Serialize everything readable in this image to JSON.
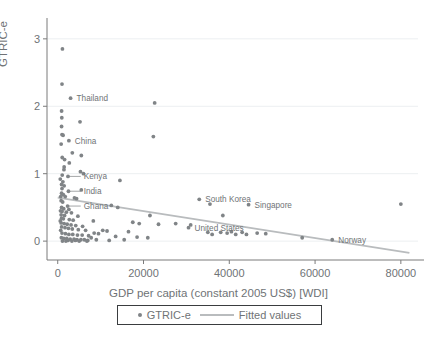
{
  "chart_data": {
    "type": "scatter",
    "title": "",
    "xlabel": "GDP per capita (constant 2005 US$) [WDI]",
    "ylabel": "GTRIC-e",
    "xlim": [
      -2500,
      84000
    ],
    "ylim": [
      -0.28,
      3.25
    ],
    "xticks": [
      0,
      20000,
      40000,
      60000,
      80000
    ],
    "xtick_labels": [
      "0",
      "20000",
      "40000",
      "60000",
      "80000"
    ],
    "yticks": [
      0,
      1,
      2,
      3
    ],
    "ytick_labels": [
      "0",
      "1",
      "2",
      "3"
    ],
    "grid": "horizontal",
    "legend_position": "bottom-center",
    "legend": [
      {
        "label": "GTRIC-e",
        "marker": "dot",
        "color": "#808487"
      },
      {
        "label": "Fitted values",
        "marker": "line",
        "color": "#b9bcbe"
      }
    ],
    "series": [
      {
        "name": "GTRIC-e",
        "marker_color": "#808487",
        "points": [
          {
            "x": 1100,
            "y": 2.85
          },
          {
            "x": 1000,
            "y": 2.33
          },
          {
            "x": 3000,
            "y": 2.12,
            "label": "Thailand"
          },
          {
            "x": 22600,
            "y": 2.05
          },
          {
            "x": 900,
            "y": 1.93
          },
          {
            "x": 950,
            "y": 1.83
          },
          {
            "x": 5200,
            "y": 1.77
          },
          {
            "x": 900,
            "y": 1.7
          },
          {
            "x": 1000,
            "y": 1.58
          },
          {
            "x": 1250,
            "y": 1.57
          },
          {
            "x": 22300,
            "y": 1.55
          },
          {
            "x": 2600,
            "y": 1.49,
            "label": "China"
          },
          {
            "x": 800,
            "y": 1.44
          },
          {
            "x": 3400,
            "y": 1.31
          },
          {
            "x": 5500,
            "y": 1.27
          },
          {
            "x": 1050,
            "y": 1.24
          },
          {
            "x": 1600,
            "y": 1.21
          },
          {
            "x": 2700,
            "y": 1.16
          },
          {
            "x": 1500,
            "y": 1.1
          },
          {
            "x": 1450,
            "y": 1.06
          },
          {
            "x": 5300,
            "y": 1.03
          },
          {
            "x": 6000,
            "y": 1.0
          },
          {
            "x": 1050,
            "y": 0.98
          },
          {
            "x": 2400,
            "y": 0.96,
            "label": "Kenya"
          },
          {
            "x": 14500,
            "y": 0.9
          },
          {
            "x": 1200,
            "y": 0.88
          },
          {
            "x": 900,
            "y": 0.84
          },
          {
            "x": 1500,
            "y": 0.82
          },
          {
            "x": 1000,
            "y": 0.78
          },
          {
            "x": 5500,
            "y": 0.76
          },
          {
            "x": 2500,
            "y": 0.74,
            "label": "India"
          },
          {
            "x": 900,
            "y": 0.71
          },
          {
            "x": 1300,
            "y": 0.69
          },
          {
            "x": 1750,
            "y": 0.66
          },
          {
            "x": 3900,
            "y": 0.64
          },
          {
            "x": 4400,
            "y": 0.63
          },
          {
            "x": 800,
            "y": 0.6
          },
          {
            "x": 1150,
            "y": 0.58
          },
          {
            "x": 33000,
            "y": 0.62,
            "label": "South Korea"
          },
          {
            "x": 35500,
            "y": 0.55
          },
          {
            "x": 44500,
            "y": 0.54,
            "label": "Singapore"
          },
          {
            "x": 80000,
            "y": 0.55
          },
          {
            "x": 2300,
            "y": 0.52,
            "label": "Ghana"
          },
          {
            "x": 900,
            "y": 0.5
          },
          {
            "x": 1400,
            "y": 0.48
          },
          {
            "x": 2600,
            "y": 0.47
          },
          {
            "x": 12500,
            "y": 0.53
          },
          {
            "x": 14000,
            "y": 0.5
          },
          {
            "x": 1000,
            "y": 0.44
          },
          {
            "x": 2000,
            "y": 0.43
          },
          {
            "x": 3200,
            "y": 0.42
          },
          {
            "x": 800,
            "y": 0.39
          },
          {
            "x": 1600,
            "y": 0.38
          },
          {
            "x": 4700,
            "y": 0.37
          },
          {
            "x": 21500,
            "y": 0.38
          },
          {
            "x": 38500,
            "y": 0.38
          },
          {
            "x": 900,
            "y": 0.34
          },
          {
            "x": 1300,
            "y": 0.33
          },
          {
            "x": 2700,
            "y": 0.32
          },
          {
            "x": 3600,
            "y": 0.31
          },
          {
            "x": 8300,
            "y": 0.3
          },
          {
            "x": 17500,
            "y": 0.28
          },
          {
            "x": 19000,
            "y": 0.26
          },
          {
            "x": 23500,
            "y": 0.25
          },
          {
            "x": 27500,
            "y": 0.26
          },
          {
            "x": 31000,
            "y": 0.24
          },
          {
            "x": 800,
            "y": 0.27
          },
          {
            "x": 1500,
            "y": 0.26
          },
          {
            "x": 2200,
            "y": 0.25
          },
          {
            "x": 3100,
            "y": 0.24
          },
          {
            "x": 4200,
            "y": 0.23
          },
          {
            "x": 5800,
            "y": 0.22
          },
          {
            "x": 900,
            "y": 0.21
          },
          {
            "x": 1700,
            "y": 0.2
          },
          {
            "x": 2500,
            "y": 0.19
          },
          {
            "x": 3400,
            "y": 0.18
          },
          {
            "x": 4800,
            "y": 0.17
          },
          {
            "x": 6500,
            "y": 0.16
          },
          {
            "x": 10500,
            "y": 0.16
          },
          {
            "x": 11500,
            "y": 0.15
          },
          {
            "x": 16500,
            "y": 0.14
          },
          {
            "x": 30500,
            "y": 0.2,
            "label": "United States"
          },
          {
            "x": 1000,
            "y": 0.12
          },
          {
            "x": 1800,
            "y": 0.11
          },
          {
            "x": 2600,
            "y": 0.1
          },
          {
            "x": 3500,
            "y": 0.1
          },
          {
            "x": 4600,
            "y": 0.09
          },
          {
            "x": 5700,
            "y": 0.09
          },
          {
            "x": 7200,
            "y": 0.08
          },
          {
            "x": 8500,
            "y": 0.12
          },
          {
            "x": 9500,
            "y": 0.11
          },
          {
            "x": 13500,
            "y": 0.07
          },
          {
            "x": 18500,
            "y": 0.06
          },
          {
            "x": 21000,
            "y": 0.05
          },
          {
            "x": 850,
            "y": 0.05
          },
          {
            "x": 1400,
            "y": 0.04
          },
          {
            "x": 2100,
            "y": 0.04
          },
          {
            "x": 2900,
            "y": 0.03
          },
          {
            "x": 3800,
            "y": 0.03
          },
          {
            "x": 4500,
            "y": 0.02
          },
          {
            "x": 5400,
            "y": 0.02
          },
          {
            "x": 6200,
            "y": 0.02
          },
          {
            "x": 7000,
            "y": 0.01
          },
          {
            "x": 7800,
            "y": 0.05
          },
          {
            "x": 9000,
            "y": 0.02
          },
          {
            "x": 12000,
            "y": 0.01
          },
          {
            "x": 15500,
            "y": 0.02
          },
          {
            "x": 1100,
            "y": 0.0
          },
          {
            "x": 1900,
            "y": 0.0
          },
          {
            "x": 2400,
            "y": 0.01
          },
          {
            "x": 3300,
            "y": 0.0
          },
          {
            "x": 4100,
            "y": 0.01
          },
          {
            "x": 5000,
            "y": 0.0
          },
          {
            "x": 6800,
            "y": 0.0
          },
          {
            "x": 700,
            "y": 0.16
          },
          {
            "x": 600,
            "y": 0.3
          },
          {
            "x": 650,
            "y": 0.45
          },
          {
            "x": 700,
            "y": 0.66
          },
          {
            "x": 600,
            "y": 0.92
          },
          {
            "x": 38000,
            "y": 0.13
          },
          {
            "x": 39500,
            "y": 0.12
          },
          {
            "x": 40500,
            "y": 0.14
          },
          {
            "x": 41500,
            "y": 0.1
          },
          {
            "x": 43000,
            "y": 0.13
          },
          {
            "x": 44000,
            "y": 0.1
          },
          {
            "x": 46500,
            "y": 0.12
          },
          {
            "x": 48500,
            "y": 0.11
          },
          {
            "x": 35000,
            "y": 0.13
          },
          {
            "x": 36000,
            "y": 0.1
          },
          {
            "x": 57000,
            "y": 0.05
          },
          {
            "x": 64000,
            "y": 0.02,
            "label": "Norway"
          }
        ]
      }
    ],
    "fit_line": {
      "name": "Fitted values",
      "color": "#b9bcbe",
      "x0": 0,
      "y0": 0.645,
      "x1": 82000,
      "y1": -0.175
    },
    "annotations": [
      {
        "text": "Thailand",
        "anchor_x": 3000,
        "anchor_y": 2.12,
        "leader": false
      },
      {
        "text": "China",
        "anchor_x": 2600,
        "anchor_y": 1.49,
        "leader": false
      },
      {
        "text": "Kenya",
        "anchor_x": 2400,
        "anchor_y": 0.96,
        "leader": true
      },
      {
        "text": "India",
        "anchor_x": 2500,
        "anchor_y": 0.74,
        "leader": true
      },
      {
        "text": "Ghana",
        "anchor_x": 2300,
        "anchor_y": 0.52,
        "leader": true
      },
      {
        "text": "South Korea",
        "anchor_x": 33000,
        "anchor_y": 0.62,
        "leader": false
      },
      {
        "text": "Singapore",
        "anchor_x": 44500,
        "anchor_y": 0.54,
        "leader": false
      },
      {
        "text": "United States",
        "anchor_x": 30500,
        "anchor_y": 0.2,
        "leader": false
      },
      {
        "text": "Norway",
        "anchor_x": 64000,
        "anchor_y": 0.02,
        "leader": false
      }
    ]
  }
}
